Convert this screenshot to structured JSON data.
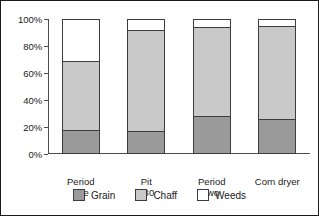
{
  "chart_data": {
    "type": "bar",
    "subtype": "stacked-percentage-column",
    "title": "",
    "subtitle": "",
    "xlabel": "",
    "ylabel": "",
    "ylim": [
      0,
      100
    ],
    "yticks": [
      0,
      20,
      40,
      60,
      80,
      100
    ],
    "ytick_labels": [
      "0%",
      "20%",
      "40%",
      "60%",
      "80%",
      "100%"
    ],
    "grid": false,
    "legend_position": "bottom-center",
    "categories": [
      "Period one",
      "Pit 180",
      "Period two",
      "Corn dryer"
    ],
    "category_labels_wrapped": [
      "Period\none",
      "Pit\n180",
      "Period\ntwo",
      "Corn dryer"
    ],
    "series": [
      {
        "name": "Grain",
        "color": "#9a9a9a",
        "values": [
          18,
          17,
          28,
          26
        ]
      },
      {
        "name": "Chaff",
        "color": "#c9c9c9",
        "values": [
          51,
          75,
          66,
          69
        ]
      },
      {
        "name": "Weeds",
        "color": "#ffffff",
        "values": [
          31,
          8,
          6,
          5
        ]
      }
    ],
    "stack_tops": {
      "grain": [
        18,
        17,
        28,
        26
      ],
      "chaff": [
        69,
        92,
        94,
        95
      ],
      "weeds": [
        100,
        100,
        100,
        100
      ]
    }
  },
  "yaxis": {
    "ticks": [
      {
        "label": "100%",
        "value": 100
      },
      {
        "label": "80%",
        "value": 80
      },
      {
        "label": "60%",
        "value": 60
      },
      {
        "label": "40%",
        "value": 40
      },
      {
        "label": "20%",
        "value": 20
      },
      {
        "label": "0%",
        "value": 0
      }
    ]
  },
  "legend": {
    "items": [
      {
        "label": "Grain",
        "swatch": "grain"
      },
      {
        "label": "Chaff",
        "swatch": "chaff"
      },
      {
        "label": "Weeds",
        "swatch": "weeds"
      }
    ]
  },
  "colors": {
    "grain": "#9a9a9a",
    "chaff": "#c9c9c9",
    "weeds": "#ffffff",
    "axis": "#4d4d4d",
    "outline": "#3d3d3d",
    "text": "#1a1a1a",
    "frame": "#1a1a1a",
    "background": "#ffffff"
  }
}
